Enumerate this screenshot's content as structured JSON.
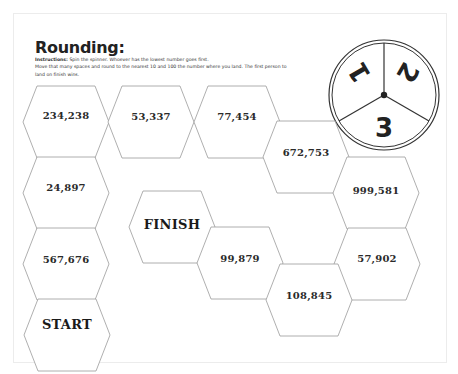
{
  "worksheet": {
    "title": "Rounding:",
    "instructions_label": "Instructions:",
    "instructions_line1": " Spin the spinner.  Whoever has the lowest number goes first.",
    "instructions_line2": "Move that many spaces and round to the nearest 10 and 100 the number where you land. The first person to land on finish wins."
  },
  "spinner": {
    "segments": [
      "1",
      "2",
      "3"
    ]
  },
  "board": {
    "spaces": [
      {
        "id": "start",
        "label": "START"
      },
      {
        "id": "s1",
        "label": "567,676"
      },
      {
        "id": "s2",
        "label": "24,897"
      },
      {
        "id": "s3",
        "label": "234,238"
      },
      {
        "id": "s4",
        "label": "53,337"
      },
      {
        "id": "s5",
        "label": "77,454"
      },
      {
        "id": "s6",
        "label": "672,753"
      },
      {
        "id": "s7",
        "label": "999,581"
      },
      {
        "id": "s8",
        "label": "57,902"
      },
      {
        "id": "s9",
        "label": "108,845"
      },
      {
        "id": "s10",
        "label": "99,879"
      },
      {
        "id": "finish",
        "label": "FINISH"
      }
    ]
  }
}
